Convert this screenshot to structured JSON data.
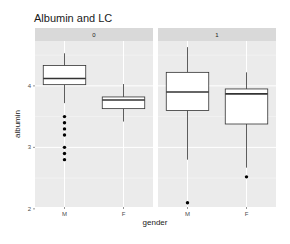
{
  "chart_data": {
    "type": "boxplot",
    "title": "Albumin and LC",
    "xlabel": "gender",
    "ylabel": "albumin",
    "ylim": [
      2.03,
      4.73
    ],
    "y_ticks": [
      2,
      3,
      4
    ],
    "y_tick_labels": [
      "2",
      "3",
      "4"
    ],
    "categories": [
      "M",
      "F"
    ],
    "grid": true,
    "legend": null,
    "facet_variable": "LC",
    "panels": [
      {
        "label": "0",
        "boxes": [
          {
            "category": "M",
            "whisker_low": 3.72,
            "q1": 4.02,
            "median": 4.12,
            "q3": 4.33,
            "whisker_high": 4.53,
            "outliers": [
              3.5,
              3.4,
              3.3,
              3.2,
              3.0,
              2.9,
              2.8
            ]
          },
          {
            "category": "F",
            "whisker_low": 3.42,
            "q1": 3.63,
            "median": 3.77,
            "q3": 3.82,
            "whisker_high": 4.03,
            "outliers": []
          }
        ]
      },
      {
        "label": "1",
        "boxes": [
          {
            "category": "M",
            "whisker_low": 2.8,
            "q1": 3.6,
            "median": 3.9,
            "q3": 4.22,
            "whisker_high": 4.63,
            "outliers": [
              2.1
            ]
          },
          {
            "category": "F",
            "whisker_low": 2.67,
            "q1": 3.38,
            "median": 3.87,
            "q3": 3.95,
            "whisker_high": 4.22,
            "outliers": [
              2.52
            ]
          }
        ]
      }
    ]
  },
  "colors": {
    "panel_bg": "#ebebeb",
    "strip_bg": "#d9d9d9",
    "grid_major": "#ffffff",
    "grid_minor": "#f5f5f5",
    "box_fill": "#ffffff",
    "box_stroke": "#333333",
    "outlier": "#000000"
  }
}
